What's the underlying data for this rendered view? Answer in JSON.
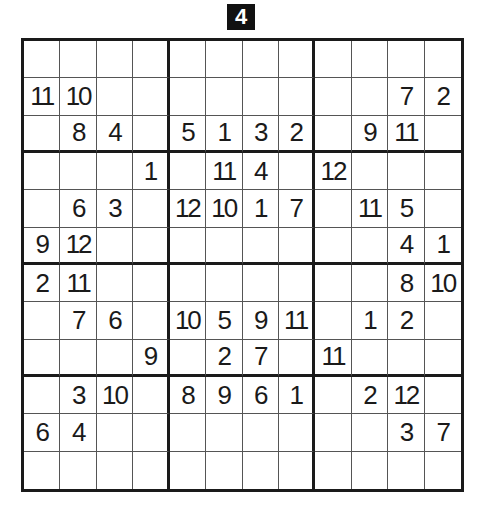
{
  "puzzle": {
    "number": "4",
    "size": 12,
    "box_rows": 3,
    "box_cols": 4,
    "grid": [
      [
        "",
        "",
        "",
        "",
        "",
        "",
        "",
        "",
        "",
        "",
        "",
        ""
      ],
      [
        "11",
        "10",
        "",
        "",
        "",
        "",
        "",
        "",
        "",
        "",
        "7",
        "2"
      ],
      [
        "",
        "8",
        "4",
        "",
        "5",
        "1",
        "3",
        "2",
        "",
        "9",
        "11",
        ""
      ],
      [
        "",
        "",
        "",
        "1",
        "",
        "11",
        "4",
        "",
        "12",
        "",
        "",
        ""
      ],
      [
        "",
        "6",
        "3",
        "",
        "12",
        "10",
        "1",
        "7",
        "",
        "11",
        "5",
        ""
      ],
      [
        "9",
        "12",
        "",
        "",
        "",
        "",
        "",
        "",
        "",
        "",
        "4",
        "1"
      ],
      [
        "2",
        "11",
        "",
        "",
        "",
        "",
        "",
        "",
        "",
        "",
        "8",
        "10"
      ],
      [
        "",
        "7",
        "6",
        "",
        "10",
        "5",
        "9",
        "11",
        "",
        "1",
        "2",
        ""
      ],
      [
        "",
        "",
        "",
        "9",
        "",
        "2",
        "7",
        "",
        "11",
        "",
        "",
        ""
      ],
      [
        "",
        "3",
        "10",
        "",
        "8",
        "9",
        "6",
        "1",
        "",
        "2",
        "12",
        ""
      ],
      [
        "6",
        "4",
        "",
        "",
        "",
        "",
        "",
        "",
        "",
        "",
        "3",
        "7"
      ],
      [
        "",
        "",
        "",
        "",
        "",
        "",
        "",
        "",
        "",
        "",
        "",
        ""
      ]
    ]
  }
}
